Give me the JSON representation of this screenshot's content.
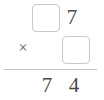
{
  "problem": {
    "type": "vertical-multiplication",
    "operator_symbol": "×",
    "operator_name": "multiplication-sign",
    "multiplicand": {
      "tens": {
        "value": "",
        "is_blank": true,
        "label": "blank-box"
      },
      "ones": {
        "value": "7",
        "is_blank": false
      }
    },
    "multiplier": {
      "value": "",
      "is_blank": true,
      "label": "blank-box"
    },
    "product": {
      "tens": "7",
      "ones": "4",
      "full": "74"
    }
  },
  "colors": {
    "background": "#ffffff",
    "digit_text": "#4a4a4a",
    "operator_text": "#5a5a5a",
    "box_border": "#c9c9c9",
    "rule": "#c4c4c4"
  }
}
